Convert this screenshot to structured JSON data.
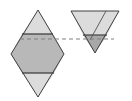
{
  "diagram": {
    "colors": {
      "light_fill": "#dcdcdc",
      "mid_fill": "#b8b8b8",
      "dark_fill": "#a8a8a8",
      "stroke": "#404040",
      "dashed": "#808080"
    }
  }
}
